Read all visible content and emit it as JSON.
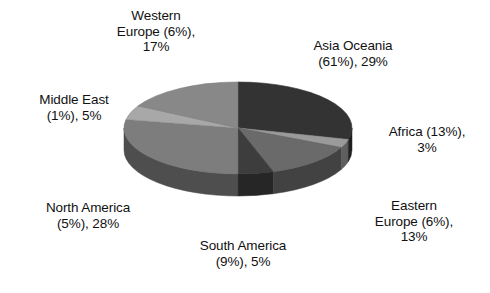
{
  "chart_data": {
    "type": "pie",
    "title": "",
    "subtitle": "",
    "xlabel": "",
    "ylabel": "",
    "legend_position": "none",
    "grid": false,
    "style": "3d-pie",
    "start_angle_deg": 0,
    "direction": "clockwise",
    "labels": [
      "Western Europe (6%), 17%",
      "Asia Oceania (61%), 29%",
      "Africa (13%), 3%",
      "Eastern Europe (6%), 13%",
      "South America (9%), 5%",
      "North America (5%), 28%",
      "Middle East (1%), 5%"
    ],
    "categories": [
      "Asia Oceania",
      "Africa",
      "Eastern Europe",
      "South America",
      "North America",
      "Middle East",
      "Western Europe"
    ],
    "values": [
      29,
      3,
      13,
      5,
      28,
      5,
      17
    ],
    "secondary_values": [
      61,
      13,
      6,
      9,
      5,
      1,
      6
    ],
    "value_unit": "%",
    "secondary_unit": "%",
    "colors": [
      "#333333",
      "#9a9a9a",
      "#6a6a6a",
      "#3d3d3d",
      "#7d7d7d",
      "#a8a8a8",
      "#888888"
    ]
  },
  "labels": {
    "western_europe": "Western\nEurope (6%),\n17%",
    "asia_oceania": "Asia Oceania\n(61%), 29%",
    "middle_east": "Middle East\n(1%), 5%",
    "africa": "Africa (13%),\n3%",
    "north_america": "North America\n(5%), 28%",
    "eastern_europe": "Eastern\nEurope (6%),\n13%",
    "south_america": "South America\n(9%), 5%"
  }
}
